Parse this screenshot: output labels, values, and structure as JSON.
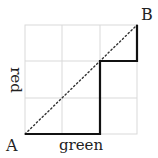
{
  "diagram": {
    "type": "lattice-path",
    "grid": {
      "cols": 3,
      "rows": 3,
      "color": "#d9d9d9"
    },
    "points": {
      "start": {
        "label": "A"
      },
      "end": {
        "label": "B"
      }
    },
    "axes": {
      "x_label": "green",
      "y_label": "red"
    },
    "path": {
      "steps": [
        "right",
        "right",
        "up",
        "up",
        "right",
        "up"
      ],
      "color": "#111111"
    },
    "diagonal": {
      "style": "dotted",
      "color": "#333333"
    }
  }
}
